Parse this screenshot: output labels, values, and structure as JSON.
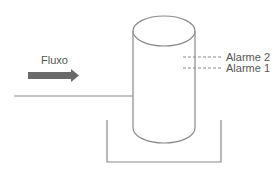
{
  "diagram": {
    "flow_label": "Fluxo",
    "alarms": [
      {
        "label": "Alarme 2"
      },
      {
        "label": "Alarme 1"
      }
    ],
    "colors": {
      "line": "#8a8a8a",
      "arrow": "#6a6a6a",
      "text": "#555555"
    }
  }
}
